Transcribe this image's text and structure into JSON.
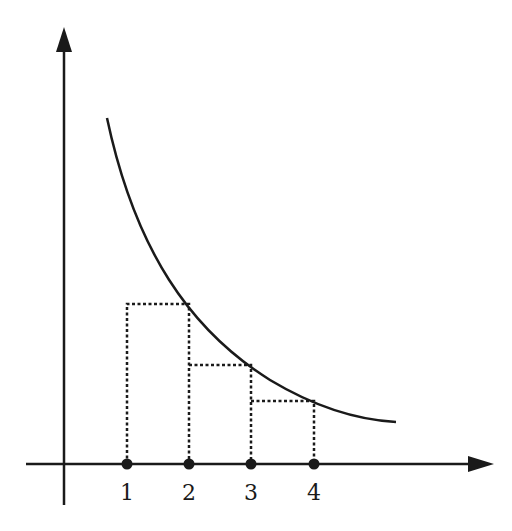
{
  "diagram": {
    "colors": {
      "ink": "#1a1a1a",
      "background": "#ffffff"
    },
    "axes": {
      "x_axis": "horizontal arrow",
      "y_axis": "vertical arrow"
    },
    "tick_labels": [
      "1",
      "2",
      "3",
      "4"
    ],
    "points": [
      {
        "label": "1",
        "x": 127
      },
      {
        "label": "2",
        "x": 189
      },
      {
        "label": "3",
        "x": 251
      },
      {
        "label": "4",
        "x": 314
      }
    ],
    "rectangles": [
      {
        "from": "1",
        "to": "2",
        "height_at": "2"
      },
      {
        "from": "2",
        "to": "3",
        "height_at": "3"
      },
      {
        "from": "3",
        "to": "4",
        "height_at": "4"
      }
    ],
    "curve": "decreasing convex curve (e.g. y = 1/x)"
  }
}
